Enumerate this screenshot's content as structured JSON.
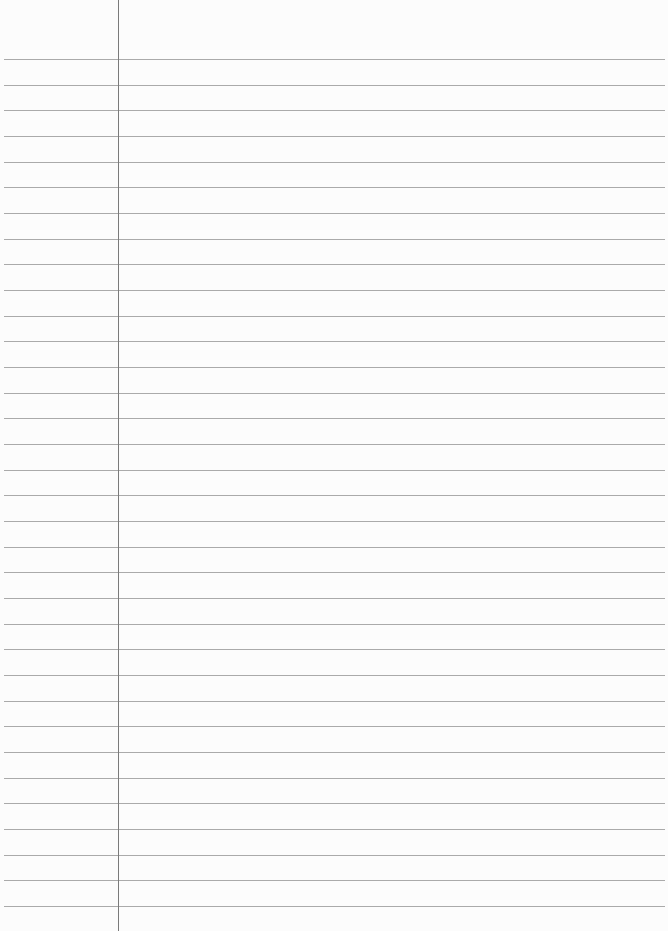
{
  "paper": {
    "type": "lined-paper",
    "line_count": 34,
    "first_line_y": 59,
    "line_spacing": 25.67,
    "margin_x": 118,
    "colors": {
      "background": "#fcfcfc",
      "rule": "#8f8f8f",
      "margin": "#7a7a7a"
    }
  }
}
